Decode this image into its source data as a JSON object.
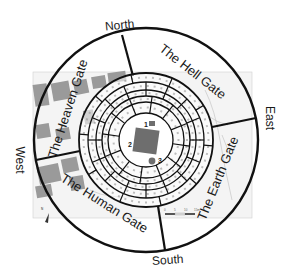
{
  "diagram": {
    "title": "",
    "center": [
      146,
      140
    ],
    "outer_radius": 112,
    "ring_radii": [
      67,
      58,
      50,
      44,
      38,
      27
    ],
    "colors": {
      "line": "#111111",
      "map_bg": "#f4f4f4",
      "block": "#9a9a9a",
      "building": "#6e6e6e",
      "ring_text": "#8a8a8a"
    },
    "directions": [
      {
        "id": "north",
        "label": "North",
        "x": 120,
        "y": 29,
        "rotate": -6
      },
      {
        "id": "east",
        "label": "East",
        "x": 266,
        "y": 118,
        "rotate": 90
      },
      {
        "id": "south",
        "label": "South",
        "x": 168,
        "y": 264,
        "rotate": -4
      },
      {
        "id": "west",
        "label": "West",
        "x": 16,
        "y": 160,
        "rotate": 90
      }
    ],
    "gates": [
      {
        "id": "heaven",
        "label": "The Heaven Gate",
        "x": 72,
        "y": 110,
        "rotate": -72
      },
      {
        "id": "hell",
        "label": "The Hell Gate",
        "x": 190,
        "y": 75,
        "rotate": 38
      },
      {
        "id": "earth",
        "label": "The Earth Gate",
        "x": 222,
        "y": 180,
        "rotate": -68
      },
      {
        "id": "human",
        "label": "The Human Gate",
        "x": 102,
        "y": 207,
        "rotate": 32
      }
    ],
    "dividers": [
      {
        "from": [
          122,
          35
        ],
        "to": [
          133,
          76
        ]
      },
      {
        "from": [
          256,
          118
        ],
        "to": [
          212,
          127
        ]
      },
      {
        "from": [
          165,
          250
        ],
        "to": [
          158,
          206
        ]
      },
      {
        "from": [
          36,
          160
        ],
        "to": [
          80,
          151
        ]
      }
    ],
    "center_markers": [
      {
        "id": "1",
        "label": "1",
        "x": 144,
        "y": 127
      },
      {
        "id": "2",
        "label": "2",
        "x": 128,
        "y": 147
      },
      {
        "id": "3",
        "label": "3",
        "x": 158,
        "y": 163
      }
    ],
    "scale_bar": {
      "ticks": [
        "0",
        "5",
        "10",
        "15m"
      ]
    },
    "north_arrow": {
      "label": "N"
    }
  }
}
